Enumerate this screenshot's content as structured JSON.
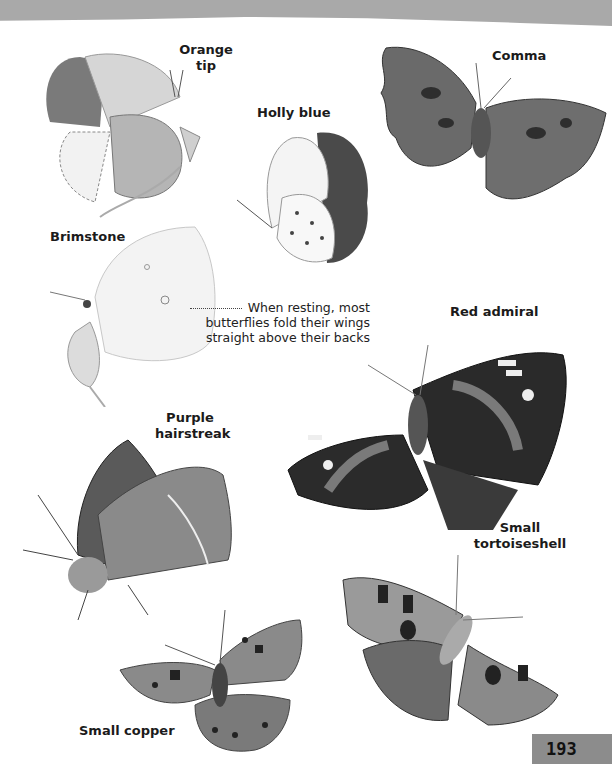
{
  "page": {
    "number": "193",
    "note": "When resting, most butterflies fold their wings straight above their backs"
  },
  "butterflies": [
    {
      "name": "Orange tip",
      "line1": "Orange",
      "line2": "tip",
      "icon": "orange-tip-illustration"
    },
    {
      "name": "Holly blue",
      "icon": "holly-blue-illustration"
    },
    {
      "name": "Comma",
      "icon": "comma-illustration"
    },
    {
      "name": "Brimstone",
      "icon": "brimstone-illustration"
    },
    {
      "name": "Red admiral",
      "icon": "red-admiral-illustration"
    },
    {
      "name": "Purple hairstreak",
      "line1": "Purple",
      "line2": "hairstreak",
      "icon": "purple-hairstreak-illustration"
    },
    {
      "name": "Small tortoiseshell",
      "line1": "Small",
      "line2": "tortoiseshell",
      "icon": "small-tortoiseshell-illustration"
    },
    {
      "name": "Small copper",
      "icon": "small-copper-illustration"
    }
  ],
  "colors": {
    "header_strip": "#a9a9a9",
    "page_tab": "#8c8c8c",
    "text": "#1b1b1b"
  }
}
